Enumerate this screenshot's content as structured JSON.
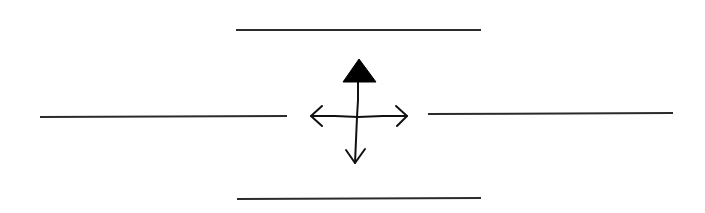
{
  "diagram": {
    "background": "#ffffff",
    "line_color": "#2b2b2b",
    "arrow_color": "#111111",
    "lines": [
      {
        "id": "top",
        "x1": 236,
        "y1": 30,
        "x2": 481,
        "y2": 30
      },
      {
        "id": "left",
        "x1": 40,
        "y1": 117,
        "x2": 287,
        "y2": 116
      },
      {
        "id": "right",
        "x1": 428,
        "y1": 114,
        "x2": 673,
        "y2": 113
      },
      {
        "id": "bottom",
        "x1": 237,
        "y1": 199,
        "x2": 481,
        "y2": 198
      }
    ],
    "compass": {
      "center": {
        "x": 358,
        "y": 117
      },
      "up": {
        "style": "filled-triangle",
        "apex": [
          359,
          59
        ],
        "base_left": [
          343,
          82
        ],
        "base_right": [
          376,
          82
        ]
      },
      "down": {
        "style": "open-arrowhead",
        "tip": [
          355,
          163
        ]
      },
      "left": {
        "style": "open-arrowhead",
        "tip": [
          311,
          116
        ]
      },
      "right": {
        "style": "open-arrowhead",
        "tip": [
          407,
          116
        ]
      }
    }
  }
}
